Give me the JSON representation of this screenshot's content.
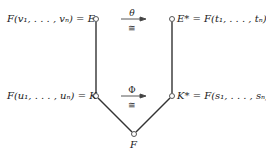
{
  "diagram": {
    "nodes": {
      "E": {
        "label": "F(v₁, . . . , vₙ) = E"
      },
      "E_star": {
        "label": "E* = F(t₁, . . . , tₙ)"
      },
      "K": {
        "label": "F(u₁, . . . , uₙ) = K"
      },
      "K_star": {
        "label": "K* = F(s₁, . . . , sₙ)"
      },
      "F": {
        "label": "F"
      }
    },
    "arrows": [
      {
        "from": "E",
        "to": "E_star",
        "above": "θ",
        "below": "≅"
      },
      {
        "from": "K",
        "to": "K_star",
        "above": "Φ",
        "below": "≅"
      }
    ],
    "edges": [
      [
        "E",
        "K"
      ],
      [
        "E_star",
        "K_star"
      ],
      [
        "K",
        "F"
      ],
      [
        "K_star",
        "F"
      ]
    ]
  }
}
